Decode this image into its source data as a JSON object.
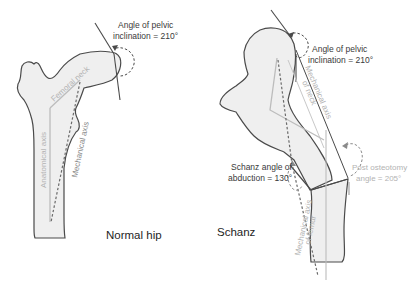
{
  "figure": {
    "panels": [
      {
        "id": "normal",
        "caption": "Normal hip",
        "annotations": {
          "pelvic_angle_line1": "Angle of pelvic",
          "pelvic_angle_line2": "inclination = 210°",
          "femoral_neck": "Femoral neck",
          "anatomical_axis": "Anatomical axis",
          "mechanical_axis": "Mechanical axis"
        }
      },
      {
        "id": "schanz",
        "caption": "Schanz",
        "annotations": {
          "pelvic_angle_line1": "Angle of pelvic",
          "pelvic_angle_line2": "inclination = 210°",
          "mech_axis_neck_line1": "Mechanical axis",
          "mech_axis_neck_line2": "of neck",
          "schanz_angle_line1": "Schanz angle of",
          "schanz_angle_line2": "abduction = 130°",
          "post_osteotomy_line1": "Post osteotomy",
          "post_osteotomy_line2": "angle = 205°",
          "mech_axis_femur_line1": "Mechanical axis",
          "mech_axis_femur_line2": "of femur"
        }
      }
    ],
    "colors": {
      "bone_fill": "#efefef",
      "outline": "#4a4a4a",
      "axis_light": "#b8b8b8",
      "dashed_axis": "#6a6a6a",
      "text_dark": "#3a3a3a",
      "text_light": "#b3b3b3"
    }
  }
}
